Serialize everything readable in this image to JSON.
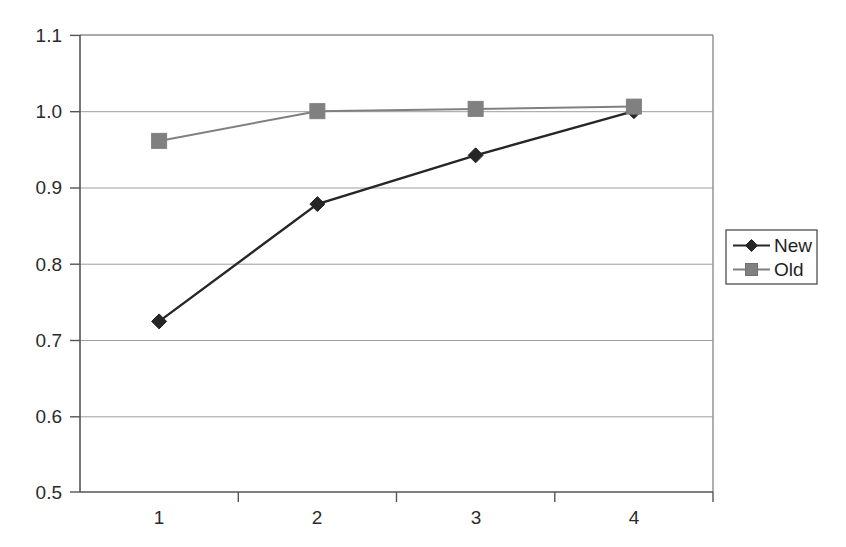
{
  "chart_data": {
    "type": "line",
    "title": "",
    "subtitle": "",
    "xlabel": "",
    "ylabel": "",
    "categories": [
      "1",
      "2",
      "3",
      "4"
    ],
    "x": [
      1,
      2,
      3,
      4
    ],
    "series": [
      {
        "name": "New",
        "values": [
          0.724,
          0.878,
          0.942,
          1.0
        ],
        "color": "#262626",
        "marker": "diamond"
      },
      {
        "name": "Old",
        "values": [
          0.961,
          1.0,
          1.003,
          1.006
        ],
        "color": "#808080",
        "marker": "square"
      }
    ],
    "ylim": [
      0.5,
      1.1
    ],
    "yticks": [
      0.5,
      0.6,
      0.7,
      0.8,
      0.9,
      1.0,
      1.1
    ],
    "ytick_labels": [
      "0.5",
      "0.6",
      "0.7",
      "0.8",
      "0.9",
      "1.0",
      "1.1"
    ],
    "xtick_labels": [
      "1",
      "2",
      "3",
      "4"
    ],
    "grid": "horizontal",
    "legend_position": "right",
    "legend_entries": [
      "New",
      "Old"
    ],
    "colors": {
      "series_new": "#262626",
      "series_old": "#808080",
      "gridline": "#9a9a9a",
      "axis": "#555555",
      "plot_border": "#777777",
      "background": "#ffffff"
    }
  },
  "axes": {
    "y_ticks": [
      {
        "label": "1.1",
        "value": 1.1
      },
      {
        "label": "1.0",
        "value": 1.0
      },
      {
        "label": "0.9",
        "value": 0.9
      },
      {
        "label": "0.8",
        "value": 0.8
      },
      {
        "label": "0.7",
        "value": 0.7
      },
      {
        "label": "0.6",
        "value": 0.6
      },
      {
        "label": "0.5",
        "value": 0.5
      }
    ],
    "x_ticks": [
      {
        "label": "1"
      },
      {
        "label": "2"
      },
      {
        "label": "3"
      },
      {
        "label": "4"
      }
    ]
  },
  "legend": {
    "items": [
      {
        "label": "New"
      },
      {
        "label": "Old"
      }
    ]
  }
}
